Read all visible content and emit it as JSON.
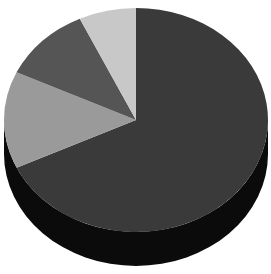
{
  "chart_data": {
    "type": "pie",
    "title": "",
    "style": "3d",
    "legend": "none",
    "labels_visible": false,
    "categories": [
      "Slice A",
      "Slice B",
      "Slice C",
      "Slice D"
    ],
    "values": [
      68,
      14,
      11,
      7
    ],
    "colors": [
      "#3a3a3a",
      "#9a9a9a",
      "#555555",
      "#c8c8c8"
    ],
    "start_angle_deg": 0,
    "direction": "clockwise-from-top"
  },
  "colors": {
    "side": "#0b0b0b",
    "background": "#ffffff"
  }
}
